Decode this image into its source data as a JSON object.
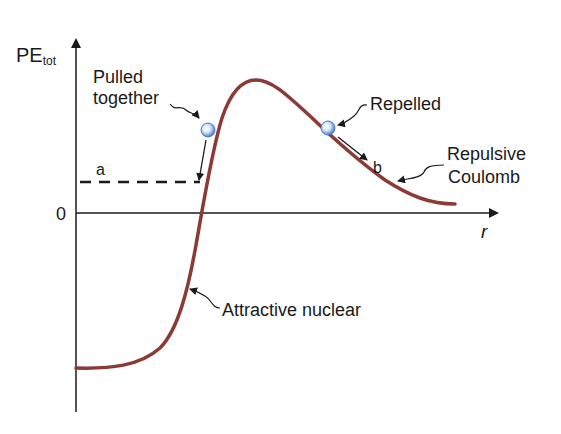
{
  "diagram": {
    "y_axis_label": "PE",
    "y_axis_label_sub": "tot",
    "x_axis_label": "r",
    "zero_label": "0",
    "labels": {
      "pulled_line1": "Pulled",
      "pulled_line2": "together",
      "repelled": "Repelled",
      "repulsive_line1": "Repulsive",
      "repulsive_line2": "Coulomb",
      "attractive": "Attractive nuclear",
      "point_a": "a",
      "point_b": "b"
    },
    "colors": {
      "curve": "#8b3a36",
      "axes": "#1a1a1a",
      "ball": "#5b8fd6"
    }
  }
}
